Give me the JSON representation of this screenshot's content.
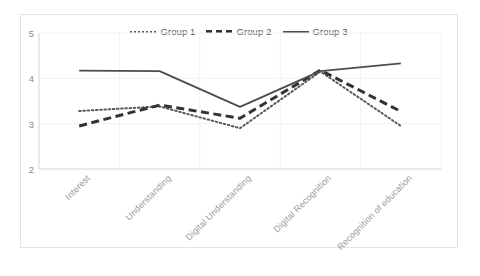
{
  "chart_data": {
    "type": "line",
    "title": "",
    "xlabel": "",
    "ylabel": "",
    "categories": [
      "Interest",
      "Understanding",
      "Digital Understanding",
      "Digital Recognition",
      "Recognition of education"
    ],
    "series": [
      {
        "name": "Group 1",
        "style": "dotted",
        "color": "#595959",
        "values": [
          3.28,
          3.38,
          2.9,
          4.15,
          2.95
        ]
      },
      {
        "name": "Group 2",
        "style": "dashed",
        "color": "#333333",
        "values": [
          2.95,
          3.41,
          3.12,
          4.18,
          3.27
        ]
      },
      {
        "name": "Group 3",
        "style": "solid",
        "color": "#4d4d4d",
        "values": [
          4.17,
          4.16,
          3.37,
          4.16,
          4.33
        ]
      }
    ],
    "ylim": [
      2,
      5
    ],
    "yticks": [
      5,
      4,
      3,
      2
    ],
    "ytick_labels": [
      "5",
      "4",
      "3",
      "2"
    ],
    "grid": true,
    "grid_color": "#f2f2f2",
    "legend_position": "top-center",
    "plot_background": "#ffffff",
    "border_color": "#e3e3e3"
  },
  "legend": {
    "entries": [
      {
        "label": "Group 1"
      },
      {
        "label": "Group 2"
      },
      {
        "label": "Group 3"
      }
    ]
  }
}
